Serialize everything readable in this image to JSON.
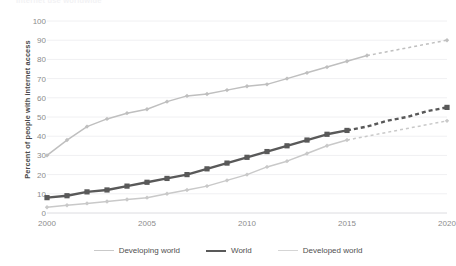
{
  "chart_data": {
    "type": "line",
    "title": "Internet use worldwide",
    "xlabel": "",
    "ylabel": "Percent of people with internet access",
    "xlim": [
      2000,
      2020
    ],
    "ylim": [
      0,
      100
    ],
    "yticks": [
      0,
      10,
      20,
      30,
      40,
      50,
      60,
      70,
      80,
      90,
      100
    ],
    "xticks": [
      2000,
      2005,
      2010,
      2015,
      2020
    ],
    "grid": true,
    "legend_position": "bottom",
    "x": [
      2000,
      2001,
      2002,
      2003,
      2004,
      2005,
      2006,
      2007,
      2008,
      2009,
      2010,
      2011,
      2012,
      2013,
      2014,
      2015,
      2016,
      2017,
      2018,
      2019,
      2020
    ],
    "series": [
      {
        "name": "Developing world",
        "color": "#c9c9c9",
        "marker": "diamond",
        "values": [
          3,
          4,
          5,
          6,
          7,
          8,
          10,
          12,
          14,
          17,
          20,
          24,
          27,
          31,
          35,
          38,
          40,
          42,
          44,
          46,
          48
        ],
        "solid_through": 2015,
        "projected_from": 2015
      },
      {
        "name": "World",
        "color": "#595959",
        "marker": "square",
        "values": [
          8,
          9,
          11,
          12,
          14,
          16,
          18,
          20,
          23,
          26,
          29,
          32,
          35,
          38,
          41,
          43,
          45,
          48,
          50,
          53,
          55
        ],
        "solid_through": 2015,
        "projected_from": 2015
      },
      {
        "name": "Developed world",
        "color": "#bfbfbf",
        "marker": "diamond",
        "values": [
          30,
          38,
          45,
          49,
          52,
          54,
          58,
          61,
          62,
          64,
          66,
          67,
          70,
          73,
          76,
          79,
          82,
          84,
          86,
          88,
          90
        ],
        "solid_through": 2016,
        "projected_from": 2016
      }
    ]
  },
  "axis": {
    "y_title": "Percent of people with internet access",
    "y_ticks": [
      "100",
      "90",
      "80",
      "70",
      "60",
      "50",
      "40",
      "30",
      "20",
      "10",
      "0"
    ],
    "x_ticks": [
      "2000",
      "2005",
      "2010",
      "2015",
      "2020"
    ]
  },
  "legend": {
    "items": [
      {
        "label": "Developing world",
        "color": "#c9c9c9",
        "width": "1.6px"
      },
      {
        "label": "World",
        "color": "#595959",
        "width": "2.6px"
      },
      {
        "label": "Developed world",
        "color": "#d5d5d5",
        "width": "1.6px"
      }
    ]
  }
}
